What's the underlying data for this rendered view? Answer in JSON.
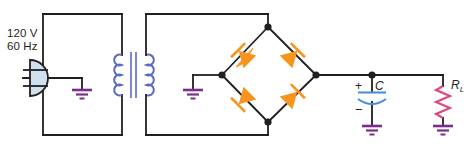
{
  "diagram": {
    "colors": {
      "wire": "#231f20",
      "diode": "#f7941e",
      "coil": "#5b6bbf",
      "capacitor": "#4a90d9",
      "resistor": "#e0457b",
      "ground": "#7b2d8b",
      "plug_fill": "#cfe0ef",
      "plug_stroke": "#231f20",
      "text": "#231f20"
    }
  },
  "source": {
    "name": "ac-mains-plug",
    "voltage": "120 V",
    "frequency": "60 Hz"
  },
  "transformer": {
    "name": "step-down-transformer",
    "primary_turns_bumps": 4,
    "secondary_turns_bumps": 4,
    "core_lines": 2
  },
  "rectifier": {
    "name": "bridge-rectifier",
    "diode_count": 4,
    "diodes": [
      {
        "id": "D1",
        "position": "top-left",
        "direction": "up-right"
      },
      {
        "id": "D2",
        "position": "top-right",
        "direction": "up-left"
      },
      {
        "id": "D3",
        "position": "bottom-left",
        "direction": "down-left"
      },
      {
        "id": "D4",
        "position": "bottom-right",
        "direction": "up-right"
      }
    ]
  },
  "filter": {
    "capacitor": {
      "name": "filter-capacitor",
      "label": "C",
      "plus_sign": "+",
      "minus_sign": "−",
      "polarized": true
    }
  },
  "load": {
    "resistor": {
      "name": "load-resistor",
      "label": "R",
      "subscript": "L"
    }
  },
  "grounds": [
    {
      "name": "ground-primary"
    },
    {
      "name": "ground-secondary"
    },
    {
      "name": "ground-capacitor"
    },
    {
      "name": "ground-load"
    }
  ]
}
